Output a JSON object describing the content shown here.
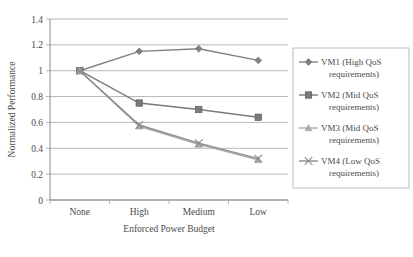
{
  "chart_data": {
    "type": "line",
    "title": "",
    "xlabel": "Enforced Power Budget",
    "ylabel": "Normalized Performance",
    "categories": [
      "None",
      "High",
      "Medium",
      "Low"
    ],
    "ylim": [
      0,
      1.4
    ],
    "yticks": [
      "0",
      "0.2",
      "0.4",
      "0.6",
      "0.8",
      "1",
      "1.2",
      "1.4"
    ],
    "ytick_values": [
      0,
      0.2,
      0.4,
      0.6,
      0.8,
      1.0,
      1.2,
      1.4
    ],
    "grid": true,
    "legend_position": "right",
    "series": [
      {
        "name": "VM1 (High QoS requirements)",
        "label_line1": "VM1 (High QoS",
        "label_line2": "requirements)",
        "marker": "diamond",
        "color": "#808080",
        "values": [
          1.0,
          1.15,
          1.17,
          1.08
        ]
      },
      {
        "name": "VM2 (Mid QoS requirements)",
        "label_line1": "VM2 (Mid QoS",
        "label_line2": "requirements)",
        "marker": "square",
        "color": "#7a7a7a",
        "values": [
          1.0,
          0.75,
          0.7,
          0.64
        ]
      },
      {
        "name": "VM3 (Mid QoS requirements)",
        "label_line1": "VM3 (Mid QoS",
        "label_line2": "requirements)",
        "marker": "triangle",
        "color": "#a9a9a9",
        "values": [
          1.0,
          0.57,
          0.43,
          0.31
        ]
      },
      {
        "name": "VM4 (Low QoS requirements)",
        "label_line1": "VM4 (Low QoS",
        "label_line2": "requirements)",
        "marker": "x",
        "color": "#8c8c8c",
        "values": [
          1.0,
          0.58,
          0.44,
          0.32
        ]
      }
    ]
  },
  "figure": {
    "background": "#ffffff",
    "axis_color": "#808080",
    "grid_color": "#a6a6a6",
    "text_color": "#4a4a4a"
  }
}
